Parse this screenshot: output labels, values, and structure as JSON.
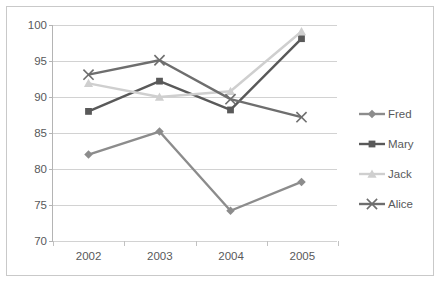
{
  "chart_data": {
    "type": "line",
    "title": "",
    "xlabel": "",
    "ylabel": "",
    "categories": [
      "2002",
      "2003",
      "2004",
      "2005"
    ],
    "ylim": [
      70,
      100
    ],
    "yticks": [
      70,
      75,
      80,
      85,
      90,
      95,
      100
    ],
    "grid": "horizontal",
    "legend_position": "right",
    "series": [
      {
        "name": "Fred",
        "marker": "diamond",
        "color": "#8c8c8c",
        "values": [
          82.0,
          85.2,
          74.2,
          78.2
        ]
      },
      {
        "name": "Mary",
        "marker": "square",
        "color": "#595959",
        "values": [
          88.0,
          92.2,
          88.2,
          98.1
        ]
      },
      {
        "name": "Jack",
        "marker": "triangle",
        "color": "#cfcfcf",
        "values": [
          91.9,
          90.0,
          90.8,
          99.1
        ]
      },
      {
        "name": "Alice",
        "marker": "x",
        "color": "#6e6e6e",
        "values": [
          93.1,
          95.1,
          89.7,
          87.2
        ]
      }
    ]
  },
  "axis": {
    "y_tick_labels": [
      "100",
      "95",
      "90",
      "85",
      "80",
      "75",
      "70"
    ],
    "x_tick_labels": [
      "2002",
      "2003",
      "2004",
      "2005"
    ]
  },
  "legend": {
    "items": [
      {
        "label": "Fred"
      },
      {
        "label": "Mary"
      },
      {
        "label": "Jack"
      },
      {
        "label": "Alice"
      }
    ]
  },
  "colors": {
    "frame": "#c9c9c9",
    "gridline": "#d2d2d2",
    "axis": "#b4b4b4",
    "text": "#58595b",
    "background": "#ffffff"
  }
}
